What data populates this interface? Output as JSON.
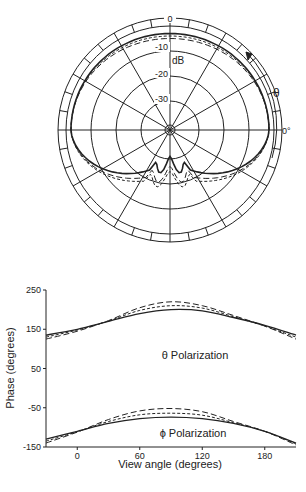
{
  "chart_data": [
    {
      "type": "polar",
      "title": "Radiation pattern",
      "radial_unit": "dB",
      "radial_labels": [
        "0",
        "-10",
        "-20",
        "-30"
      ],
      "radial_values": [
        0,
        -10,
        -20,
        -30
      ],
      "angle_label": "θ",
      "angle_zero_label": "0°",
      "angle_direction": "counterclockwise from right",
      "series": [
        {
          "name": "solid",
          "style": "solid",
          "description": "main lobe near 0 dB from -60° to 240° with dip toward bottom (~-25 dB at 270°)"
        },
        {
          "name": "long-dash",
          "style": "dashed",
          "description": "similar to solid, slightly lower at top (~-3 dB)"
        },
        {
          "name": "short-dash",
          "style": "dotted",
          "description": "similar, lower near bottom (~-20 dB)"
        }
      ]
    },
    {
      "type": "line",
      "xlabel": "View angle (degrees)",
      "ylabel": "Phase (degrees)",
      "x_ticks": [
        0,
        60,
        120,
        180
      ],
      "y_ticks": [
        250,
        150,
        50,
        -50,
        -150
      ],
      "xlim": [
        -30,
        210
      ],
      "ylim": [
        -150,
        250
      ],
      "annotations": [
        "θ Polarization",
        "ϕ Polarization"
      ],
      "groups": [
        {
          "name": "θ Polarization",
          "x": [
            -30,
            0,
            30,
            60,
            90,
            120,
            150,
            180,
            210
          ],
          "series": [
            {
              "name": "solid",
              "values": [
                135,
                150,
                170,
                190,
                200,
                197,
                180,
                160,
                135
              ]
            },
            {
              "name": "long-dash",
              "values": [
                125,
                145,
                172,
                205,
                220,
                210,
                185,
                158,
                125
              ]
            },
            {
              "name": "short-dash",
              "values": [
                130,
                148,
                171,
                198,
                210,
                204,
                182,
                158,
                130
              ]
            }
          ]
        },
        {
          "name": "ϕ Polarization",
          "x": [
            -30,
            0,
            30,
            60,
            90,
            120,
            150,
            180,
            210
          ],
          "series": [
            {
              "name": "solid",
              "values": [
                -130,
                -110,
                -90,
                -78,
                -74,
                -78,
                -90,
                -110,
                -140
              ]
            },
            {
              "name": "long-dash",
              "values": [
                -140,
                -112,
                -80,
                -58,
                -52,
                -60,
                -85,
                -110,
                -145
              ]
            },
            {
              "name": "short-dash",
              "values": [
                -135,
                -111,
                -85,
                -68,
                -64,
                -69,
                -88,
                -110,
                -142
              ]
            }
          ]
        }
      ]
    }
  ]
}
